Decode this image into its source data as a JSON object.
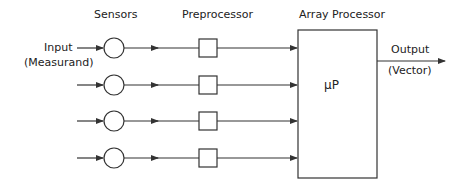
{
  "diagram": {
    "headers": {
      "sensors": "Sensors",
      "preprocessor": "Preprocessor",
      "array_processor": "Array Processor"
    },
    "input": {
      "label": "Input",
      "sublabel": "(Measurand)"
    },
    "output": {
      "label": "Output",
      "sublabel": "(Vector)"
    },
    "processor_label": "μP",
    "channels": 4,
    "line_color": "#333333"
  }
}
